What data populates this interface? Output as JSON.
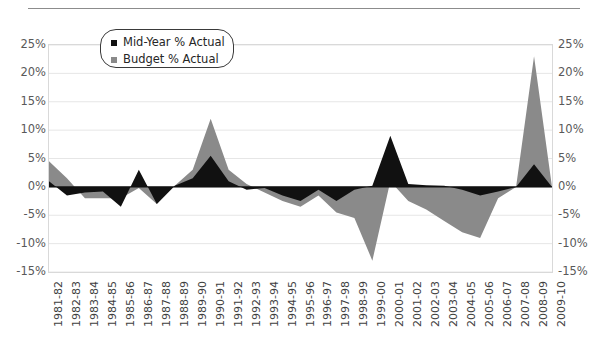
{
  "chart_data": {
    "type": "area",
    "title": "",
    "subtitle": "",
    "xlabel": "",
    "ylabel": "",
    "ylim": [
      -15,
      25
    ],
    "yticks": [
      25,
      20,
      15,
      10,
      5,
      0,
      -5,
      -10,
      -15
    ],
    "ytick_labels": [
      "25%",
      "20%",
      "15%",
      "10%",
      "5%",
      "0%",
      "-5%",
      "-10%",
      "-15%"
    ],
    "ytick_labels_right": [
      "25%",
      "20%",
      "15%",
      "10%",
      "5%",
      "0%",
      "-5%",
      "-10%",
      "-15%"
    ],
    "grid": true,
    "legend_position": "top-left-inside",
    "categories": [
      "1981-82",
      "1982-83",
      "1983-84",
      "1984-85",
      "1985-86",
      "1986-87",
      "1987-88",
      "1988-89",
      "1989-90",
      "1990-91",
      "1991-92",
      "1992-93",
      "1993-94",
      "1994-95",
      "1995-96",
      "1996-97",
      "1997-98",
      "1998-99",
      "1999-00",
      "2000-01",
      "2001-02",
      "2002-03",
      "2003-04",
      "2004-05",
      "2005-06",
      "2006-07",
      "2007-08",
      "2008-09",
      "2009-10"
    ],
    "series": [
      {
        "name": "Mid-Year % Actual",
        "color": "#111111",
        "values": [
          1.0,
          -1.5,
          -1.0,
          -0.8,
          -3.5,
          3.0,
          -3.0,
          0.2,
          1.5,
          5.5,
          1.0,
          -0.5,
          -0.2,
          -1.5,
          -2.5,
          -0.5,
          -2.5,
          -0.5,
          0.2,
          9.0,
          0.5,
          0.3,
          0.2,
          -0.5,
          -1.5,
          -0.8,
          0.0,
          4.0,
          0.0
        ]
      },
      {
        "name": "Budget % Actual",
        "color": "#8a8a8a",
        "values": [
          4.5,
          1.5,
          -2.0,
          -2.0,
          -2.0,
          -0.2,
          -3.0,
          0.2,
          3.0,
          12.0,
          3.0,
          0.5,
          -1.0,
          -2.5,
          -3.5,
          -1.5,
          -4.5,
          -5.5,
          -13.0,
          1.0,
          -2.5,
          -4.0,
          -6.0,
          -8.0,
          -9.0,
          -2.0,
          0.0,
          23.0,
          0.0
        ]
      }
    ]
  },
  "legend": {
    "items": [
      {
        "label": "Mid-Year % Actual",
        "color": "#111111"
      },
      {
        "label": "Budget % Actual",
        "color": "#8a8a8a"
      }
    ]
  }
}
